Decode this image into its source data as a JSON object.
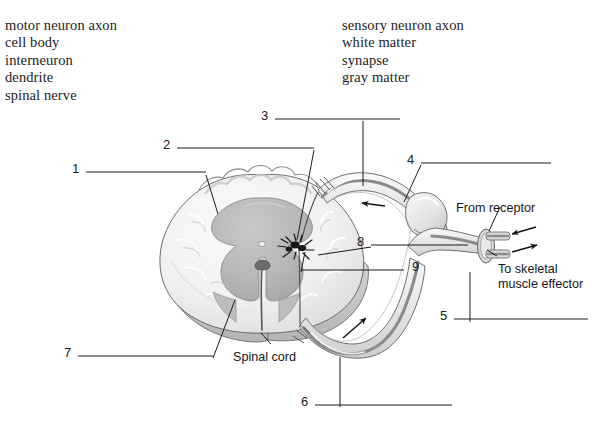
{
  "figure": {
    "title_absent": true,
    "background_color": "#ffffff",
    "ink_color": "#1b1b1b"
  },
  "word_banks": {
    "left": {
      "name": "left-word-bank",
      "items": [
        "motor neuron axon",
        "cell body",
        "interneuron",
        "dendrite",
        "spinal nerve"
      ]
    },
    "right": {
      "name": "right-word-bank",
      "items": [
        "sensory neuron axon",
        "white matter",
        "synapse",
        "gray matter"
      ]
    }
  },
  "numbered_blanks": [
    {
      "number": "1",
      "answer": "",
      "x": 72,
      "y": 170,
      "line_x1": 86,
      "line_x2": 206
    },
    {
      "number": "2",
      "answer": "",
      "x": 163,
      "y": 146,
      "line_x1": 177,
      "line_x2": 314
    },
    {
      "number": "3",
      "answer": "",
      "x": 261,
      "y": 117,
      "line_x1": 275,
      "line_x2": 400
    },
    {
      "number": "4",
      "answer": "",
      "x": 407,
      "y": 161,
      "line_x1": 421,
      "line_x2": 551
    },
    {
      "number": "5",
      "answer": "",
      "x": 440,
      "y": 317,
      "line_x1": 454,
      "line_x2": 588
    },
    {
      "number": "6",
      "answer": "",
      "x": 301,
      "y": 403,
      "line_x1": 315,
      "line_x2": 452
    },
    {
      "number": "7",
      "answer": "",
      "x": 64,
      "y": 354,
      "line_x1": 78,
      "line_x2": 213
    },
    {
      "number": "8",
      "answer": "",
      "x": 357,
      "y": 243,
      "line_x1": 371,
      "line_x2": 468
    },
    {
      "number": "9",
      "answer": "",
      "x": 412,
      "y": 268,
      "line_x1": 301,
      "line_x2": 404
    }
  ],
  "captions": [
    {
      "name": "from-receptor-caption",
      "text": "From receptor",
      "lines": [
        "From receptor"
      ],
      "x": 456,
      "y": 201
    },
    {
      "name": "to-skeletal-muscle-effector-caption",
      "text": "To skeletal muscle effector",
      "lines": [
        "To skeletal",
        "muscle effector"
      ],
      "x": 498,
      "y": 262
    },
    {
      "name": "spinal-cord-caption",
      "text": "Spinal cord",
      "lines": [
        "Spinal cord"
      ],
      "x": 233,
      "y": 350
    }
  ],
  "anatomy": {
    "structures": [
      "spinal cord cross-section",
      "white matter",
      "gray matter",
      "central canal",
      "dorsal root",
      "dorsal root ganglion",
      "ventral root",
      "spinal nerve",
      "interneuron cell body cluster",
      "sensory neuron axon",
      "motor neuron axon"
    ],
    "colors": {
      "white_matter": "#f2f2f1",
      "white_matter_shadow": "#d9d9d7",
      "gray_matter": "#b9b9b7",
      "gray_matter_shadow": "#a3a3a1",
      "nerve_sheath": "#e6e6e4",
      "nerve_axon": "#8e8e8c",
      "outline": "#5c5c5a",
      "cut_face": "#cfcfcd"
    },
    "flow_arrows": [
      {
        "name": "dorsal-inflow-arrow",
        "direction": "left",
        "meaning": "impulse toward spinal cord"
      },
      {
        "name": "ventral-outflow-arrow",
        "direction": "upper-right",
        "meaning": "impulse away from spinal cord"
      },
      {
        "name": "receptor-inflow-arrow",
        "direction": "left",
        "meaning": "from receptor"
      },
      {
        "name": "effector-outflow-arrow",
        "direction": "right",
        "meaning": "to skeletal muscle effector"
      }
    ]
  }
}
